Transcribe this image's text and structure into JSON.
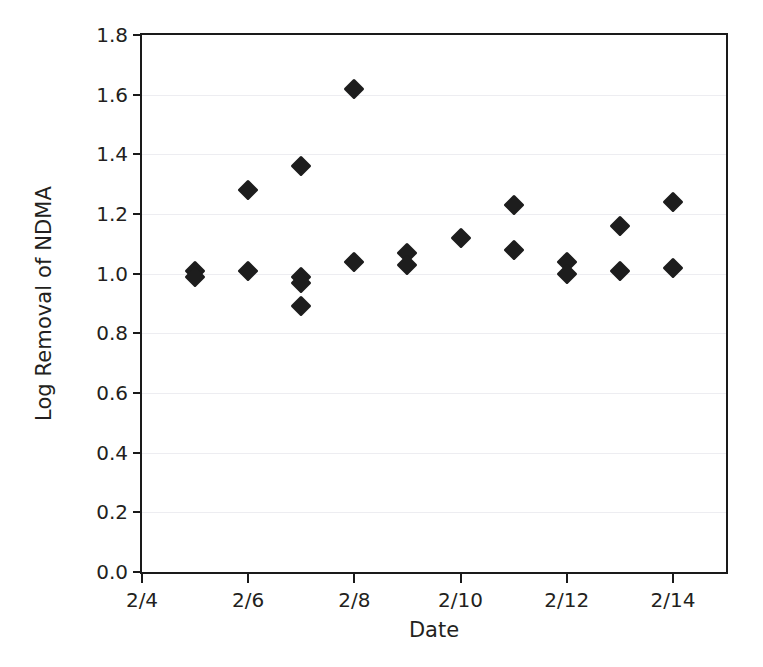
{
  "chart_data": {
    "type": "scatter",
    "title": "",
    "xlabel": "Date",
    "ylabel": "Log Removal of NDMA",
    "xlim": [
      4,
      15
    ],
    "ylim": [
      0.0,
      1.8
    ],
    "grid": true,
    "legend": "none",
    "marker": "filled-diamond",
    "marker_color": "#1d1d1d",
    "x_tick_labels": [
      "2/4",
      "2/6",
      "2/8",
      "2/10",
      "2/12",
      "2/14"
    ],
    "x_tick_values": [
      4,
      6,
      8,
      10,
      12,
      14
    ],
    "y_tick_labels": [
      "0.0",
      "0.2",
      "0.4",
      "0.6",
      "0.8",
      "1.0",
      "1.2",
      "1.4",
      "1.6",
      "1.8"
    ],
    "y_tick_values": [
      0.0,
      0.2,
      0.4,
      0.6,
      0.8,
      1.0,
      1.2,
      1.4,
      1.6,
      1.8
    ],
    "points": [
      {
        "x": 5,
        "label": "2/5",
        "y": 1.01
      },
      {
        "x": 5,
        "label": "2/5",
        "y": 0.99
      },
      {
        "x": 6,
        "label": "2/6",
        "y": 1.28
      },
      {
        "x": 6,
        "label": "2/6",
        "y": 1.01
      },
      {
        "x": 7,
        "label": "2/7",
        "y": 1.36
      },
      {
        "x": 7,
        "label": "2/7",
        "y": 0.99
      },
      {
        "x": 7,
        "label": "2/7",
        "y": 0.97
      },
      {
        "x": 7,
        "label": "2/7",
        "y": 0.89
      },
      {
        "x": 8,
        "label": "2/8",
        "y": 1.62
      },
      {
        "x": 8,
        "label": "2/8",
        "y": 1.04
      },
      {
        "x": 9,
        "label": "2/9",
        "y": 1.07
      },
      {
        "x": 9,
        "label": "2/9",
        "y": 1.03
      },
      {
        "x": 10,
        "label": "2/10",
        "y": 1.12
      },
      {
        "x": 11,
        "label": "2/11",
        "y": 1.23
      },
      {
        "x": 11,
        "label": "2/11",
        "y": 1.08
      },
      {
        "x": 12,
        "label": "2/12",
        "y": 1.04
      },
      {
        "x": 12,
        "label": "2/12",
        "y": 1.0
      },
      {
        "x": 13,
        "label": "2/13",
        "y": 1.16
      },
      {
        "x": 13,
        "label": "2/13",
        "y": 1.01
      },
      {
        "x": 14,
        "label": "2/14",
        "y": 1.24
      },
      {
        "x": 14,
        "label": "2/14",
        "y": 1.02
      }
    ]
  },
  "axes": {
    "x_title": "Date",
    "y_title": "Log Removal of NDMA"
  },
  "style": {
    "frame_color": "#1a1a1a",
    "grid_color": "#ededf1",
    "marker_color": "#1d1d1d",
    "background": "#ffffff"
  }
}
